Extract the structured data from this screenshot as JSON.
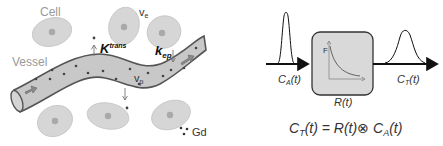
{
  "left_panel": {
    "labels": {
      "cell": "Cell",
      "ve": "v",
      "ve_sub": "e",
      "vessel": "Vessel",
      "ktrans": "K",
      "ktrans_sup": "trans",
      "kep": "k",
      "kep_sub": "ep",
      "vp": "v",
      "vp_sub": "p",
      "gd": "Gd"
    },
    "colors": {
      "cell_fill": "#d6d6d6",
      "cell_nucleus": "#a9a9a9",
      "vessel_fill": "#c8c8c8",
      "vessel_stroke": "#555555",
      "particle": "#444444"
    }
  },
  "right_panel": {
    "input_label": "C",
    "input_sub": "A",
    "input_tail": "(t)",
    "box_label": "R(t)",
    "box_axis_label": "F",
    "output_label": "C",
    "output_sub": "T",
    "output_tail": "(t)",
    "equation": {
      "lhs": "C",
      "lhs_sub": "T",
      "lhs_tail": "(t) = R(t)",
      "operator": "⊗",
      "rhs": " C",
      "rhs_sub": "A",
      "rhs_tail": "(t)"
    },
    "colors": {
      "box_fill": "#d9d9d9",
      "box_stroke": "#333333",
      "arrow": "#111111"
    }
  }
}
